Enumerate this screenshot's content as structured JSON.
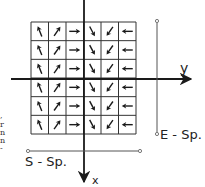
{
  "diagram": {
    "title": "",
    "grid": {
      "rows": 6,
      "cols": 6,
      "left": 31,
      "top": 22,
      "right": 136,
      "bottom": 134,
      "column_arrows": [
        "up-left",
        "up-right",
        "right",
        "down-right",
        "down-left",
        "left"
      ],
      "column_angles_deg": [
        -112,
        -55,
        0,
        62,
        125,
        180
      ]
    },
    "axes": {
      "y_axis_label": "y",
      "x_axis_label": "x"
    },
    "scan_lines": {
      "e_scan_label": "E - Sp.",
      "s_scan_label": "S - Sp."
    },
    "cropped_margin_text": [
      ",",
      "r",
      "n",
      "n",
      "-"
    ],
    "colors": {
      "line": "#1a1a1a",
      "grid": "#333333",
      "arrow": "#1a1a1a",
      "scan_line": "#555555"
    }
  }
}
